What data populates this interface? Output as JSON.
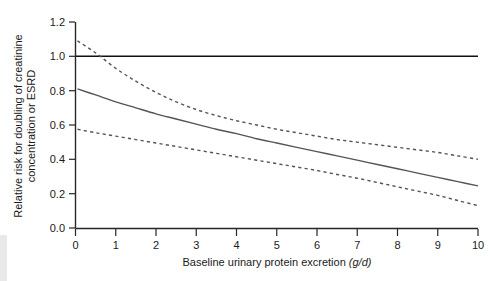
{
  "chart_data": {
    "type": "line",
    "title": "",
    "xlabel": "Baseline urinary protein excretion",
    "xlabel_unit": "(g/d)",
    "ylabel": "Relative risk for doubling of creatinine concentration or ESRD",
    "ylabel_line1": "Relative risk for doubling of creatinine",
    "ylabel_line2": "concentration or ESRD",
    "xlim": [
      0,
      10
    ],
    "ylim": [
      0.0,
      1.2
    ],
    "xticks": [
      0,
      1,
      2,
      3,
      4,
      5,
      6,
      7,
      8,
      9,
      10
    ],
    "xtick_labels": [
      "0",
      "1",
      "2",
      "3",
      "4",
      "5",
      "6",
      "7",
      "8",
      "9",
      "10"
    ],
    "yticks": [
      0.0,
      0.2,
      0.4,
      0.6,
      0.8,
      1.0,
      1.2
    ],
    "ytick_labels": [
      "0.0",
      "0.2",
      "0.4",
      "0.6",
      "0.8",
      "1.0",
      "1.2"
    ],
    "grid": false,
    "legend": "none",
    "reference_line": {
      "name": "null-effect-line",
      "orientation": "horizontal",
      "y": 1.0,
      "style": "solid",
      "color": "#111111"
    },
    "x": [
      0.05,
      0.5,
      1,
      1.5,
      2,
      2.5,
      3,
      3.5,
      4,
      4.5,
      5,
      5.5,
      6,
      6.5,
      7,
      7.5,
      8,
      8.5,
      9,
      9.5,
      10
    ],
    "series": [
      {
        "name": "Upper 95% confidence limit",
        "style": "dashed",
        "color": "#555555",
        "values": [
          1.09,
          1.02,
          0.93,
          0.855,
          0.79,
          0.735,
          0.69,
          0.655,
          0.625,
          0.6,
          0.575,
          0.555,
          0.535,
          0.515,
          0.5,
          0.485,
          0.47,
          0.455,
          0.44,
          0.42,
          0.4
        ]
      },
      {
        "name": "Adjusted relative risk",
        "style": "solid",
        "color": "#555555",
        "values": [
          0.81,
          0.775,
          0.735,
          0.7,
          0.665,
          0.635,
          0.605,
          0.575,
          0.55,
          0.52,
          0.495,
          0.47,
          0.445,
          0.42,
          0.395,
          0.37,
          0.345,
          0.32,
          0.295,
          0.27,
          0.245
        ]
      },
      {
        "name": "Lower 95% confidence limit",
        "style": "dashed",
        "color": "#555555",
        "values": [
          0.575,
          0.555,
          0.535,
          0.515,
          0.495,
          0.475,
          0.455,
          0.435,
          0.415,
          0.395,
          0.375,
          0.355,
          0.335,
          0.312,
          0.29,
          0.265,
          0.24,
          0.215,
          0.19,
          0.16,
          0.13
        ]
      }
    ]
  }
}
